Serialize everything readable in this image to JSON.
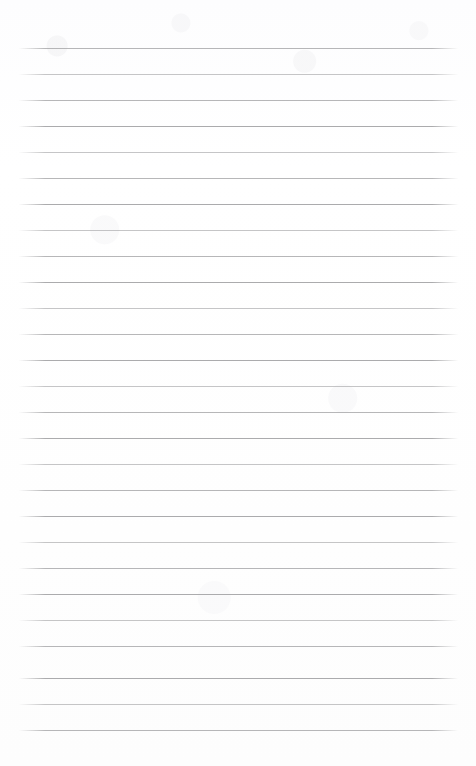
{
  "page": {
    "kind": "scanned-lined-paper",
    "width": 476,
    "height": 766,
    "background_color": "#fefefe",
    "rule_color": "#a3a3a5",
    "content": "",
    "visible_text": ""
  },
  "ruling": {
    "line_count": 27,
    "first_line_y": 48,
    "line_spacing": 26,
    "line_thickness": 1,
    "left_margin_x": 19,
    "right_margin_x": 458,
    "line_width": 439,
    "top_margin": 48,
    "bottom_margin": 36,
    "lines": [
      {
        "index": 1,
        "y": 48,
        "weight": "mid"
      },
      {
        "index": 2,
        "y": 74,
        "weight": "light"
      },
      {
        "index": 3,
        "y": 100,
        "weight": "mid"
      },
      {
        "index": 4,
        "y": 126,
        "weight": "normal"
      },
      {
        "index": 5,
        "y": 152,
        "weight": "light"
      },
      {
        "index": 6,
        "y": 178,
        "weight": "mid"
      },
      {
        "index": 7,
        "y": 204,
        "weight": "normal"
      },
      {
        "index": 8,
        "y": 230,
        "weight": "light"
      },
      {
        "index": 9,
        "y": 256,
        "weight": "mid"
      },
      {
        "index": 10,
        "y": 282,
        "weight": "normal"
      },
      {
        "index": 11,
        "y": 308,
        "weight": "light"
      },
      {
        "index": 12,
        "y": 334,
        "weight": "mid"
      },
      {
        "index": 13,
        "y": 360,
        "weight": "normal"
      },
      {
        "index": 14,
        "y": 386,
        "weight": "light"
      },
      {
        "index": 15,
        "y": 412,
        "weight": "mid"
      },
      {
        "index": 16,
        "y": 438,
        "weight": "normal"
      },
      {
        "index": 17,
        "y": 464,
        "weight": "light"
      },
      {
        "index": 18,
        "y": 490,
        "weight": "mid"
      },
      {
        "index": 19,
        "y": 516,
        "weight": "normal"
      },
      {
        "index": 20,
        "y": 542,
        "weight": "light"
      },
      {
        "index": 21,
        "y": 568,
        "weight": "mid"
      },
      {
        "index": 22,
        "y": 594,
        "weight": "normal"
      },
      {
        "index": 23,
        "y": 620,
        "weight": "light"
      },
      {
        "index": 24,
        "y": 646,
        "weight": "mid"
      },
      {
        "index": 25,
        "y": 678,
        "weight": "normal"
      },
      {
        "index": 26,
        "y": 704,
        "weight": "light"
      },
      {
        "index": 27,
        "y": 730,
        "weight": "mid"
      }
    ]
  }
}
